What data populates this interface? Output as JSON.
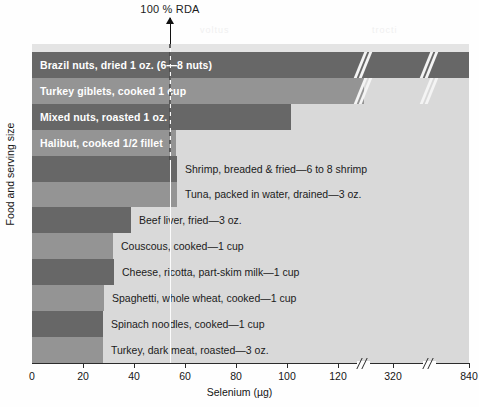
{
  "annotation": {
    "rda_label": "100 % RDA"
  },
  "ghosts": {
    "one": "voltus",
    "two": "trocti"
  },
  "axis": {
    "x_title": "Selenium (µg)",
    "y_title": "Food and serving size"
  },
  "chart_data": {
    "type": "bar",
    "orientation": "horizontal",
    "title": "",
    "xlabel": "Selenium (µg)",
    "ylabel": "Food and serving size",
    "xlim": [
      0,
      840
    ],
    "x_axis_note": "Broken axis: linear 0-120, then break, 320, then break, 840",
    "xticks": [
      0,
      20,
      40,
      60,
      80,
      100,
      120,
      320,
      840
    ],
    "xticklabels": [
      "0",
      "20",
      "40",
      "60",
      "80",
      "100",
      "120",
      "320",
      "840"
    ],
    "grid": false,
    "legend": "none",
    "annotations": [
      {
        "label": "100 % RDA",
        "value": 55,
        "type": "vline-arrow"
      }
    ],
    "categories": [
      "Brazil nuts, dried 1 oz. (6—8 nuts)",
      "Turkey giblets, cooked 1 cup",
      "Mixed nuts, roasted 1 oz.",
      "Halibut, cooked 1/2 fillet",
      "Shrimp, breaded & fried—6 to 8 shrimp",
      "Tuna, packed in water, drained—3 oz.",
      "Beef liver, fried—3 oz.",
      "Couscous, cooked—1 cup",
      "Cheese, ricotta, part-skim milk—1 cup",
      "Spaghetti, whole wheat, cooked—1 cup",
      "Spinach noodles, cooked—1 cup",
      "Turkey, dark meat, roasted—3 oz."
    ],
    "values": [
      840,
      364,
      120,
      74,
      74,
      74,
      48,
      40,
      41,
      36,
      35,
      35
    ]
  },
  "bars": [
    {
      "label": "Brazil nuts, dried 1 oz. (6—8 nuts)",
      "value": 840,
      "shade": "dark",
      "label_inside": true,
      "px_width": 437
    },
    {
      "label": "Turkey giblets, cooked 1 cup",
      "value": 364,
      "shade": "light",
      "label_inside": true,
      "px_width": 332
    },
    {
      "label": "Mixed nuts, roasted 1 oz.",
      "value": 120,
      "shade": "dark",
      "label_inside": true,
      "px_width": 259
    },
    {
      "label": "Halibut, cooked 1/2 fillet",
      "value": 74,
      "shade": "light",
      "label_inside": true,
      "px_width": 144
    },
    {
      "label": "Shrimp, breaded & fried—6 to 8 shrimp",
      "value": 74,
      "shade": "dark",
      "label_inside": false,
      "px_width": 145
    },
    {
      "label": "Tuna, packed in water, drained—3 oz.",
      "value": 74,
      "shade": "light",
      "label_inside": false,
      "px_width": 145
    },
    {
      "label": "Beef liver, fried—3 oz.",
      "value": 48,
      "shade": "dark",
      "label_inside": false,
      "px_width": 99
    },
    {
      "label": "Couscous, cooked—1 cup",
      "value": 40,
      "shade": "light",
      "label_inside": false,
      "px_width": 81
    },
    {
      "label": "Cheese, ricotta, part-skim milk—1 cup",
      "value": 41,
      "shade": "dark",
      "label_inside": false,
      "px_width": 82
    },
    {
      "label": "Spaghetti, whole wheat, cooked—1 cup",
      "value": 36,
      "shade": "light",
      "label_inside": false,
      "px_width": 72
    },
    {
      "label": "Spinach noodles, cooked—1 cup",
      "value": 35,
      "shade": "dark",
      "label_inside": false,
      "px_width": 71
    },
    {
      "label": "Turkey, dark meat, roasted—3 oz.",
      "value": 35,
      "shade": "light",
      "label_inside": false,
      "px_width": 71
    }
  ],
  "ticks": [
    {
      "label": "0",
      "px": 0
    },
    {
      "label": "20",
      "px": 51
    },
    {
      "label": "40",
      "px": 102
    },
    {
      "label": "60",
      "px": 153
    },
    {
      "label": "80",
      "px": 204
    },
    {
      "label": "100",
      "px": 255
    },
    {
      "label": "120",
      "px": 306
    },
    {
      "label": "320",
      "px": 361
    },
    {
      "label": "840",
      "px": 437
    }
  ],
  "breaks": [
    {
      "px": 331
    },
    {
      "px": 397
    }
  ],
  "colors": {
    "bar_dark": "#676767",
    "bar_light": "#949494",
    "plot_bg": "#d9d9d9",
    "axis": "#2b2b2b",
    "page_bg": "#fefefe"
  }
}
